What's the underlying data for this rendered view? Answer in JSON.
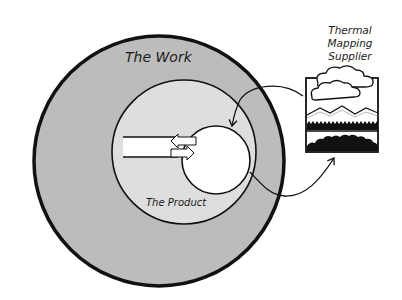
{
  "diagram": {
    "outer_circle": {
      "label": "The Work",
      "fill": "#bcbcbc",
      "stroke": "#111111"
    },
    "inner_circle": {
      "label": "The Product",
      "fill": "#dedede",
      "stroke": "#111111"
    },
    "core_circle": {
      "fill": "#ffffff",
      "stroke": "#111111"
    },
    "supplier": {
      "label_lines": [
        "Thermal",
        "Mapping",
        "Supplier"
      ],
      "icon": "thermal-map-landscape-icon"
    },
    "connections": [
      {
        "from": "supplier",
        "to": "core_circle",
        "direction": "inbound"
      },
      {
        "from": "core_circle",
        "to": "supplier",
        "direction": "outbound"
      }
    ],
    "channel": {
      "description": "data flow channel into product core with two-way arrows"
    }
  }
}
